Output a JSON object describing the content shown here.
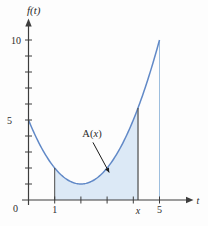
{
  "chart_data": {
    "type": "area",
    "title": "",
    "ylabel": "f(t)",
    "xlabel": "t",
    "origin_label": "0",
    "xlim": [
      0,
      6.3
    ],
    "ylim": [
      0,
      11.3
    ],
    "grid": false,
    "x_ticks": [
      1,
      2,
      3,
      4,
      5
    ],
    "x_labeled_ticks": [
      {
        "value": 1,
        "label": "1"
      },
      {
        "value": 5,
        "label": "5"
      }
    ],
    "y_ticks": [
      1,
      2,
      3,
      4,
      5,
      6,
      7,
      8,
      9,
      10
    ],
    "y_labeled_ticks": [
      {
        "value": 5,
        "label": "5"
      },
      {
        "value": 10,
        "label": "10"
      }
    ],
    "curve": {
      "shape": "parabola",
      "vertex": [
        2,
        1
      ],
      "coefficient_a": 1,
      "t_range": [
        0,
        5
      ],
      "key_points": [
        [
          0,
          5
        ],
        [
          1,
          2
        ],
        [
          2,
          1
        ],
        [
          3,
          2
        ],
        [
          4,
          5
        ],
        [
          5,
          10
        ]
      ]
    },
    "shaded_region": {
      "from_t": 1,
      "to_t": 4.18,
      "right_boundary_label": "x"
    },
    "guide_line_t": 5,
    "annotation": {
      "label": "A(x)",
      "label_prefix": "A(",
      "label_var": "x",
      "label_suffix": ")",
      "label_pos": [
        2.42,
        3.94
      ],
      "arrow_from": [
        2.46,
        3.6
      ],
      "arrow_to": [
        3.08,
        1.72
      ]
    },
    "colors": {
      "curve": "#6189c7",
      "fill": "#dce9f6",
      "axis": "#3d3d3d",
      "guide_line": "#9dbede",
      "boundary_line": "#4a4a4a",
      "annotation": "#1a1a1a"
    }
  }
}
